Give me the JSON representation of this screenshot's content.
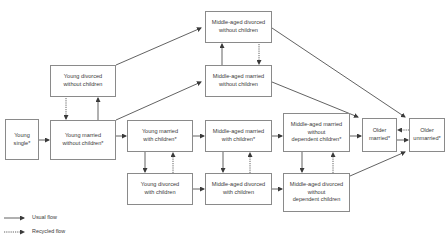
{
  "diagram": {
    "title_partial": "Figure: Life-course household trajectory",
    "nodes": [
      {
        "id": "young_single",
        "label": "Young\nsingle*",
        "x": 5,
        "y": 119,
        "w": 34,
        "h": 41
      },
      {
        "id": "young_divorced_no_children",
        "label": "Young divorced\nwithout children",
        "x": 50,
        "y": 65,
        "w": 66,
        "h": 32
      },
      {
        "id": "young_married_no_children",
        "label": "Young married\nwithout children*",
        "x": 50,
        "y": 120,
        "w": 66,
        "h": 40
      },
      {
        "id": "middle_divorced_no_children",
        "label": "Middle-aged divorced\nwithout children",
        "x": 205,
        "y": 11,
        "w": 67,
        "h": 32
      },
      {
        "id": "middle_married_no_children",
        "label": "Middle-aged married\nwithout children",
        "x": 205,
        "y": 65,
        "w": 67,
        "h": 32
      },
      {
        "id": "young_married_with_children",
        "label": "Young married\nwith children*",
        "x": 127,
        "y": 120,
        "w": 66,
        "h": 32
      },
      {
        "id": "middle_married_with_children",
        "label": "Middle-aged married\nwith children*",
        "x": 205,
        "y": 120,
        "w": 67,
        "h": 32
      },
      {
        "id": "middle_married_no_dependent",
        "label": "Middle-aged married\nwithout\ndependent children*",
        "x": 283,
        "y": 113,
        "w": 67,
        "h": 39
      },
      {
        "id": "older_married",
        "label": "Older\nmarried*",
        "x": 362,
        "y": 118,
        "w": 35,
        "h": 34
      },
      {
        "id": "older_unmarried",
        "label": "Older\nunmarried*",
        "x": 409,
        "y": 118,
        "w": 36,
        "h": 34
      },
      {
        "id": "young_divorced_with_children",
        "label": "Young divorced\nwith children",
        "x": 127,
        "y": 173,
        "w": 66,
        "h": 32
      },
      {
        "id": "middle_divorced_with_children",
        "label": "Middle-aged divorced\nwith children",
        "x": 205,
        "y": 173,
        "w": 67,
        "h": 32
      },
      {
        "id": "middle_divorced_no_dependent",
        "label": "Middle-aged divorced\nwithout\ndependent children",
        "x": 283,
        "y": 173,
        "w": 67,
        "h": 39
      }
    ],
    "edges": [
      {
        "from": "young_single",
        "to": "young_married_no_children",
        "type": "usual",
        "pts": [
          [
            39,
            140
          ],
          [
            49,
            140
          ]
        ]
      },
      {
        "from": "young_married_no_children",
        "to": "young_divorced_no_children",
        "type": "usual",
        "pts": [
          [
            98,
            120
          ],
          [
            98,
            98
          ]
        ]
      },
      {
        "from": "young_divorced_no_children",
        "to": "young_married_no_children",
        "type": "recycled",
        "pts": [
          [
            66,
            98
          ],
          [
            66,
            119
          ]
        ]
      },
      {
        "from": "young_divorced_no_children",
        "to": "middle_divorced_no_children",
        "type": "usual",
        "pts": [
          [
            116,
            65
          ],
          [
            201,
            28
          ]
        ]
      },
      {
        "from": "young_married_no_children",
        "to": "middle_married_no_children",
        "type": "usual",
        "pts": [
          [
            116,
            120
          ],
          [
            201,
            82
          ]
        ]
      },
      {
        "from": "young_married_no_children",
        "to": "young_married_with_children",
        "type": "usual",
        "pts": [
          [
            116,
            136
          ],
          [
            126,
            136
          ]
        ]
      },
      {
        "from": "middle_married_no_children",
        "to": "middle_divorced_no_children",
        "type": "usual",
        "pts": [
          [
            222,
            65
          ],
          [
            222,
            44
          ]
        ]
      },
      {
        "from": "middle_divorced_no_children",
        "to": "middle_married_no_children",
        "type": "recycled",
        "pts": [
          [
            259,
            44
          ],
          [
            259,
            64
          ]
        ]
      },
      {
        "from": "middle_divorced_no_children",
        "to": "older_unmarried",
        "type": "usual",
        "pts": [
          [
            272,
            28
          ],
          [
            405,
            117
          ]
        ]
      },
      {
        "from": "middle_married_no_children",
        "to": "older_married",
        "type": "usual",
        "pts": [
          [
            272,
            82
          ],
          [
            358,
            117
          ]
        ]
      },
      {
        "from": "young_married_with_children",
        "to": "middle_married_with_children",
        "type": "usual",
        "pts": [
          [
            193,
            136
          ],
          [
            204,
            136
          ]
        ]
      },
      {
        "from": "young_married_with_children",
        "to": "young_divorced_with_children",
        "type": "usual",
        "pts": [
          [
            145,
            152
          ],
          [
            145,
            172
          ]
        ]
      },
      {
        "from": "young_divorced_with_children",
        "to": "young_married_with_children",
        "type": "recycled",
        "pts": [
          [
            173,
            173
          ],
          [
            173,
            153
          ]
        ]
      },
      {
        "from": "middle_married_with_children",
        "to": "middle_married_no_dependent",
        "type": "usual",
        "pts": [
          [
            272,
            136
          ],
          [
            282,
            136
          ]
        ]
      },
      {
        "from": "middle_married_with_children",
        "to": "middle_divorced_with_children",
        "type": "usual",
        "pts": [
          [
            223,
            152
          ],
          [
            223,
            172
          ]
        ]
      },
      {
        "from": "middle_divorced_with_children",
        "to": "middle_married_with_children",
        "type": "recycled",
        "pts": [
          [
            250,
            173
          ],
          [
            250,
            153
          ]
        ]
      },
      {
        "from": "young_divorced_with_children",
        "to": "middle_divorced_with_children",
        "type": "usual",
        "pts": [
          [
            193,
            189
          ],
          [
            204,
            189
          ]
        ]
      },
      {
        "from": "middle_divorced_with_children",
        "to": "middle_divorced_no_dependent",
        "type": "usual",
        "pts": [
          [
            272,
            189
          ],
          [
            282,
            189
          ]
        ]
      },
      {
        "from": "middle_married_no_dependent",
        "to": "older_married",
        "type": "usual",
        "pts": [
          [
            350,
            136
          ],
          [
            361,
            136
          ]
        ]
      },
      {
        "from": "middle_married_no_dependent",
        "to": "middle_divorced_no_dependent",
        "type": "usual",
        "pts": [
          [
            302,
            152
          ],
          [
            302,
            172
          ]
        ]
      },
      {
        "from": "middle_divorced_no_dependent",
        "to": "middle_married_no_dependent",
        "type": "recycled",
        "pts": [
          [
            333,
            173
          ],
          [
            333,
            153
          ]
        ]
      },
      {
        "from": "middle_divorced_no_dependent",
        "to": "older_unmarried",
        "type": "usual",
        "pts": [
          [
            350,
            176
          ],
          [
            405,
            152
          ]
        ]
      },
      {
        "from": "older_married",
        "to": "older_unmarried",
        "type": "usual",
        "pts": [
          [
            397,
            140
          ],
          [
            408,
            140
          ]
        ]
      },
      {
        "from": "older_unmarried",
        "to": "older_married",
        "type": "recycled",
        "pts": [
          [
            409,
            130
          ],
          [
            398,
            130
          ]
        ]
      }
    ]
  },
  "legend": {
    "items": [
      {
        "type": "usual",
        "label": "Usual flow"
      },
      {
        "type": "recycled",
        "label": "Recycled flow"
      }
    ]
  },
  "colors": {
    "line": "#3a3a3a",
    "box_border": "#8a8a8a",
    "text": "#3a3a3a"
  }
}
